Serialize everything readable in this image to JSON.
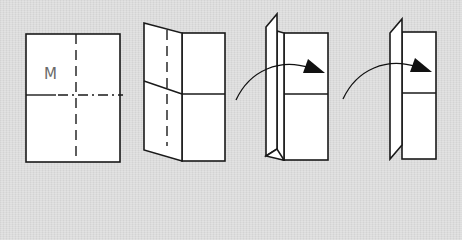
{
  "diagram": {
    "type": "origami-folding-steps",
    "background_color": "#dcdcdc",
    "line_color": "#1a1a1a",
    "paper_color": "#ffffff",
    "steps": [
      {
        "id": 1,
        "description": "Rectangular sheet with vertical valley-fold line and horizontal mountain-fold line",
        "label": "M"
      },
      {
        "id": 2,
        "description": "Left half folded forward along vertical crease, shown in perspective"
      },
      {
        "id": 3,
        "description": "Left flap standing upright; curved arrow indicates folding flap to the right"
      },
      {
        "id": 4,
        "description": "Narrower flap standing upright; curved arrow indicates folding flap to the right"
      }
    ]
  }
}
